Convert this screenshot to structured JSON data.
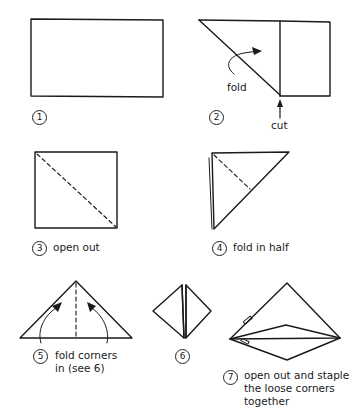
{
  "steps": [
    {
      "number": "1",
      "caption": ""
    },
    {
      "number": "2",
      "caption": "",
      "annotations": {
        "fold": "fold",
        "cut": "cut"
      }
    },
    {
      "number": "3",
      "caption": "open out"
    },
    {
      "number": "4",
      "caption": "fold in half"
    },
    {
      "number": "5",
      "caption_line1": "fold corners",
      "caption_line2": "in (see 6)"
    },
    {
      "number": "6",
      "caption": ""
    },
    {
      "number": "7",
      "caption_line1": "open out and staple",
      "caption_line2": "the loose corners",
      "caption_line3": "together"
    }
  ],
  "colors": {
    "line": "#1a1a1a",
    "background": "#ffffff"
  }
}
